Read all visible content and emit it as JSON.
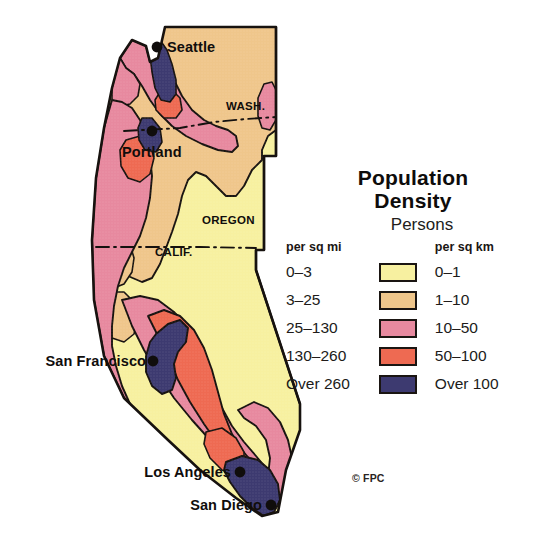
{
  "figure": {
    "kind": "thematic-map",
    "title": "Population Density",
    "region": "US Pacific Coast States",
    "credit": "© FPC"
  },
  "map": {
    "cities": [
      {
        "name": "Seattle",
        "label": "Seattle",
        "dot_x": 157,
        "dot_y": 47,
        "label_x": 167,
        "label_y": 52,
        "anchor": "start"
      },
      {
        "name": "Portland",
        "label": "Portland",
        "dot_x": 152,
        "dot_y": 131,
        "label_x": 122,
        "label_y": 157,
        "anchor": "start"
      },
      {
        "name": "San Francisco",
        "label": "San Francisco",
        "dot_x": 153,
        "dot_y": 361,
        "label_x": 146,
        "label_y": 366,
        "anchor": "end"
      },
      {
        "name": "Los Angeles",
        "label": "Los Angeles",
        "dot_x": 240,
        "dot_y": 472,
        "label_x": 231,
        "label_y": 477,
        "anchor": "end"
      },
      {
        "name": "San Diego",
        "label": "San Diego",
        "dot_x": 271,
        "dot_y": 505,
        "label_x": 262,
        "label_y": 510,
        "anchor": "end"
      }
    ],
    "states": [
      {
        "name": "WASH.",
        "label": "WASH.",
        "x": 226,
        "y": 110
      },
      {
        "name": "OREGON",
        "label": "OREGON",
        "x": 202,
        "y": 224
      },
      {
        "name": "CALIF.",
        "label": "CALIF.",
        "x": 155,
        "y": 256
      }
    ]
  },
  "legend": {
    "title_line1": "Population",
    "title_line2": "Density",
    "units_caption": "Persons",
    "header_left": "per sq mi",
    "header_right": "per sq km",
    "rows": [
      {
        "left": "0–3",
        "color": "#f7f0a0",
        "right": "0–1"
      },
      {
        "left": "3–25",
        "color": "#efc68b",
        "right": "1–10"
      },
      {
        "left": "25–130",
        "color": "#e7899f",
        "right": "10–50"
      },
      {
        "left": "130–260",
        "color": "#ee6a52",
        "right": "50–100"
      },
      {
        "left": "Over 260",
        "color": "#3d3a70",
        "right": "Over 100"
      }
    ]
  },
  "colors": {
    "band_0_3": "#f7f0a0",
    "band_3_25": "#efc68b",
    "band_25_130": "#e7899f",
    "band_130_260": "#ee6a52",
    "band_over_260": "#3d3a70",
    "outline": "#17120f",
    "background": "#ffffff",
    "text": "#100d0c"
  }
}
